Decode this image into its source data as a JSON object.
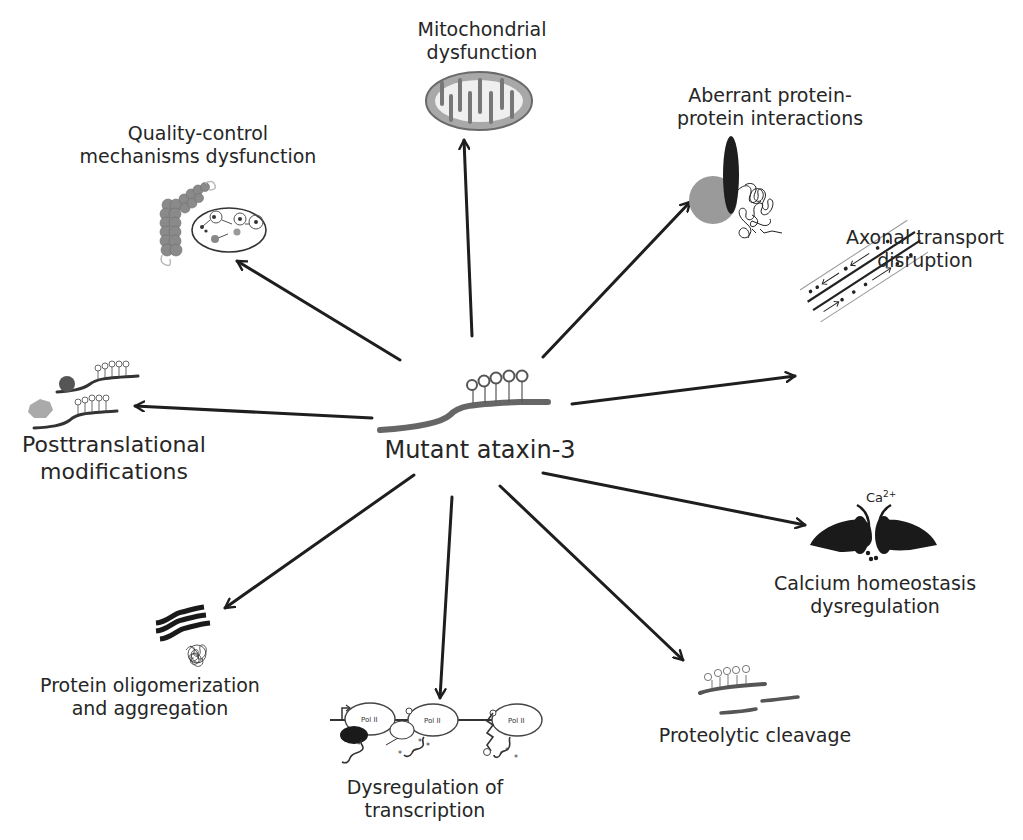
{
  "diagram": {
    "center": {
      "label": "Mutant ataxin-3",
      "glyph_label": "QQQQQ"
    },
    "nodes": [
      {
        "id": "mitochondrial",
        "lines": [
          "Mitochondrial",
          "dysfunction"
        ],
        "icon": "mitochondrion-icon"
      },
      {
        "id": "quality_control",
        "lines": [
          "Quality-control",
          "mechanisms dysfunction"
        ],
        "icon": "proteasome-autophagy-icon"
      },
      {
        "id": "aberrant_ppi",
        "lines": [
          "Aberrant protein-",
          "protein interactions"
        ],
        "icon": "protein-interaction-icon"
      },
      {
        "id": "axonal",
        "lines": [
          "Axonal transport",
          "disruption"
        ],
        "icon": "axon-microtubule-icon"
      },
      {
        "id": "ptm",
        "lines": [
          "Posttranslational",
          "modifications"
        ],
        "icon": "modified-protein-icon"
      },
      {
        "id": "calcium",
        "lines": [
          "Calcium homeostasis",
          "dysregulation"
        ],
        "icon": "calcium-channel-icon",
        "ion_label": "Ca",
        "ion_charge": "2+"
      },
      {
        "id": "oligomer",
        "lines": [
          "Protein oligomerization",
          "and aggregation"
        ],
        "icon": "aggregate-icon"
      },
      {
        "id": "transcription",
        "lines": [
          "Dysregulation of",
          "transcription"
        ],
        "icon": "rna-polymerase-icon",
        "pol_label": "Pol II"
      },
      {
        "id": "proteolytic",
        "lines": [
          "Proteolytic cleavage"
        ],
        "icon": "cleaved-protein-icon"
      }
    ],
    "edges": [
      {
        "to": "mitochondrial",
        "from_xy": [
          472,
          336
        ],
        "to_xy": [
          464,
          140
        ]
      },
      {
        "to": "quality_control",
        "from_xy": [
          400,
          360
        ],
        "to_xy": [
          237,
          261
        ]
      },
      {
        "to": "aberrant_ppi",
        "from_xy": [
          543,
          357
        ],
        "to_xy": [
          690,
          202
        ]
      },
      {
        "to": "axonal",
        "from_xy": [
          572,
          404
        ],
        "to_xy": [
          795,
          376
        ]
      },
      {
        "to": "ptm",
        "from_xy": [
          372,
          418
        ],
        "to_xy": [
          135,
          406
        ]
      },
      {
        "to": "calcium",
        "from_xy": [
          543,
          473
        ],
        "to_xy": [
          805,
          525
        ]
      },
      {
        "to": "proteolytic",
        "from_xy": [
          500,
          486
        ],
        "to_xy": [
          683,
          660
        ]
      },
      {
        "to": "transcription",
        "from_xy": [
          452,
          497
        ],
        "to_xy": [
          440,
          698
        ]
      },
      {
        "to": "oligomer",
        "from_xy": [
          414,
          475
        ],
        "to_xy": [
          225,
          608
        ]
      }
    ],
    "colors": {
      "background": "#ffffff",
      "text": "#262626",
      "arrow": "#1e1e1e",
      "protein_strand": "#5a5a5a",
      "dark_fill": "#1a1a1a",
      "grey_fill": "#8c8c8c",
      "mito_fill": "#9a9a9a"
    }
  }
}
